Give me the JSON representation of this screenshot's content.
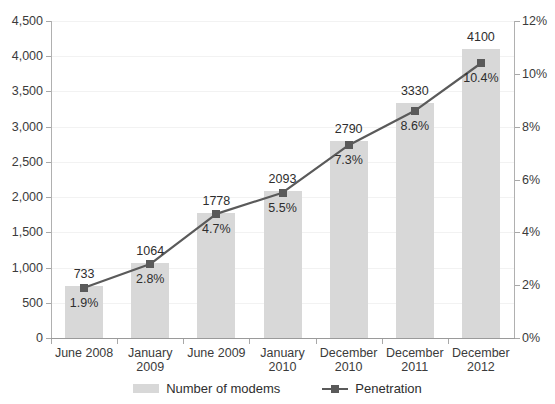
{
  "chart_data": {
    "type": "bar",
    "title": "",
    "subtitle": "",
    "xlabel": "",
    "ylabel": "",
    "y2label": "",
    "grid": true,
    "legend_position": "bottom",
    "categories": [
      "June 2008",
      "January 2009",
      "June 2009",
      "January 2010",
      "December 2010",
      "December 2011",
      "December 2012"
    ],
    "category_lines": [
      [
        "June 2008"
      ],
      [
        "January",
        "2009"
      ],
      [
        "June 2009"
      ],
      [
        "January",
        "2010"
      ],
      [
        "December",
        "2010"
      ],
      [
        "December",
        "2011"
      ],
      [
        "December",
        "2012"
      ]
    ],
    "series": [
      {
        "name": "Number of modems",
        "type": "bar",
        "axis": "left",
        "color": "#d8d8d8",
        "values": [
          733,
          1064,
          1778,
          2093,
          2790,
          3330,
          4100
        ],
        "labels": [
          "733",
          "1064",
          "1778",
          "2093",
          "2790",
          "3330",
          "4100"
        ]
      },
      {
        "name": "Penetration",
        "type": "line",
        "axis": "right",
        "color": "#5a5a5a",
        "values": [
          1.9,
          2.8,
          4.7,
          5.5,
          7.3,
          8.6,
          10.4
        ],
        "labels": [
          "1.9%",
          "2.8%",
          "4.7%",
          "5.5%",
          "7.3%",
          "8.6%",
          "10.4%"
        ]
      }
    ],
    "ylim": [
      0,
      4500
    ],
    "ytick_step": 500,
    "yticks": [
      0,
      500,
      1000,
      1500,
      2000,
      2500,
      3000,
      3500,
      4000,
      4500
    ],
    "ytick_labels": [
      "0",
      "500",
      "1,000",
      "1,500",
      "2,000",
      "2,500",
      "3,000",
      "3,500",
      "4,000",
      "4,500"
    ],
    "y2lim": [
      0,
      12
    ],
    "y2tick_step": 2,
    "y2ticks": [
      0,
      2,
      4,
      6,
      8,
      10,
      12
    ],
    "y2tick_labels": [
      "0%",
      "2%",
      "4%",
      "6%",
      "8%",
      "10%",
      "12%"
    ]
  },
  "legend": {
    "items": [
      {
        "label": "Number of modems",
        "marker": "bar-swatch"
      },
      {
        "label": "Penetration",
        "marker": "line-square-marker"
      }
    ]
  }
}
